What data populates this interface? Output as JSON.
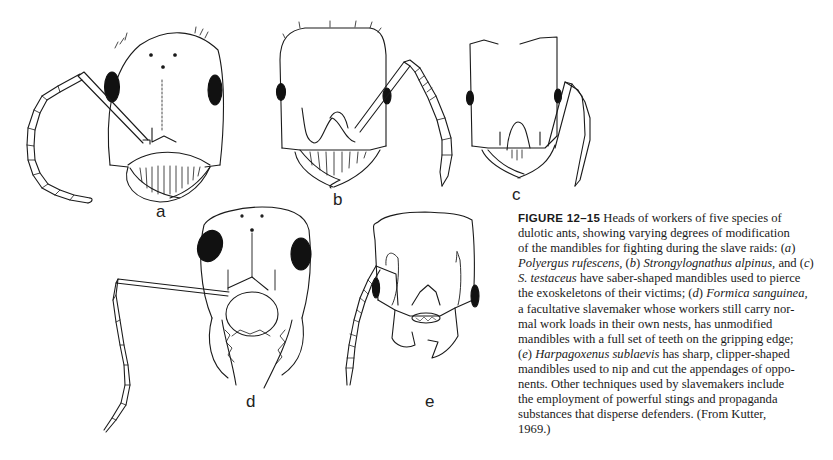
{
  "figure": {
    "number": "FIGURE 12–15",
    "panels": [
      {
        "label": "a",
        "species": "Polyergus rufescens",
        "mandibles": "saber-shaped"
      },
      {
        "label": "b",
        "species": "Strongylognathus alpinus",
        "mandibles": "saber-shaped"
      },
      {
        "label": "c",
        "species": "S. testaceus",
        "mandibles": "saber-shaped"
      },
      {
        "label": "d",
        "species": "Formica sanguinea",
        "mandibles": "unmodified, full set of teeth"
      },
      {
        "label": "e",
        "species": "Harpagoxenus sublaevis",
        "mandibles": "clipper-shaped"
      }
    ],
    "caption_lines": [
      [
        {
          "t": "FIGURE 12–15",
          "s": "fig"
        },
        {
          "t": " Heads of workers of five species of"
        }
      ],
      [
        {
          "t": "dulotic ants, showing varying degrees of modification"
        }
      ],
      [
        {
          "t": "of the mandibles for fighting during the slave raids: ("
        },
        {
          "t": "a",
          "s": "i"
        },
        {
          "t": ")"
        }
      ],
      [
        {
          "t": "Polyergus rufescens,",
          "s": "i"
        },
        {
          "t": " ("
        },
        {
          "t": "b",
          "s": "i"
        },
        {
          "t": ") "
        },
        {
          "t": "Strongylognathus alpinus,",
          "s": "i"
        },
        {
          "t": " and ("
        },
        {
          "t": "c",
          "s": "i"
        },
        {
          "t": ")"
        }
      ],
      [
        {
          "t": "S. testaceus",
          "s": "i"
        },
        {
          "t": " have saber-shaped mandibles used to pierce"
        }
      ],
      [
        {
          "t": "the exoskeletons of their victims; ("
        },
        {
          "t": "d",
          "s": "i"
        },
        {
          "t": ") "
        },
        {
          "t": "Formica sanguinea,",
          "s": "i"
        }
      ],
      [
        {
          "t": "a facultative slavemaker whose workers still carry nor-"
        }
      ],
      [
        {
          "t": "mal work loads in their own nests, has unmodified"
        }
      ],
      [
        {
          "t": "mandibles with a full set of teeth on the gripping edge;"
        }
      ],
      [
        {
          "t": "("
        },
        {
          "t": "e",
          "s": "i"
        },
        {
          "t": ") "
        },
        {
          "t": "Harpagoxenus sublaevis",
          "s": "i"
        },
        {
          "t": " has sharp, clipper-shaped"
        }
      ],
      [
        {
          "t": "mandibles used to nip and cut the appendages of oppo-"
        }
      ],
      [
        {
          "t": "nents. Other techniques used by slavemakers include"
        }
      ],
      [
        {
          "t": "the employment of powerful stings and propaganda"
        }
      ],
      [
        {
          "t": "substances that disperse defenders. (From Kutter,"
        }
      ],
      [
        {
          "t": "1969.)"
        }
      ]
    ]
  },
  "labels": {
    "a": "a",
    "b": "b",
    "c": "c",
    "d": "d",
    "e": "e"
  },
  "colors": {
    "ink": "#1a1a1a",
    "background": "#ffffff"
  }
}
